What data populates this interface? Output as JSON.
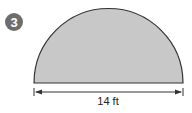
{
  "problem": {
    "number": "3",
    "badge_color": "#6d6d6d"
  },
  "figure": {
    "shape": "semicircle",
    "fill_color": "#c8c8c8",
    "stroke_color": "#333333",
    "dimension_label": "14 ft"
  }
}
